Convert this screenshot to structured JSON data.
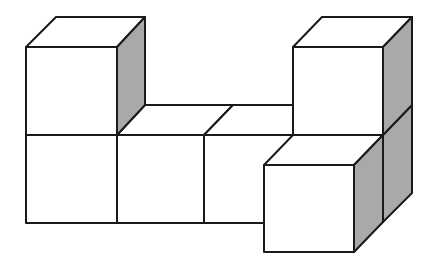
{
  "diagram": {
    "type": "isometric-cube-structure",
    "colors": {
      "front_face": "#ffffff",
      "top_face": "#ffffff",
      "side_face_shaded": "#a9a9a9",
      "edge": "#1a1a1a",
      "background": "#ffffff"
    },
    "cube_count": 7,
    "cubes": [
      {
        "id": "top-left",
        "layer": 2,
        "column": 1,
        "depth": 1
      },
      {
        "id": "bottom-1",
        "layer": 1,
        "column": 1,
        "depth": 1
      },
      {
        "id": "bottom-2",
        "layer": 1,
        "column": 2,
        "depth": 1
      },
      {
        "id": "bottom-3",
        "layer": 1,
        "column": 3,
        "depth": 1
      },
      {
        "id": "bottom-4",
        "layer": 1,
        "column": 4,
        "depth": 1
      },
      {
        "id": "top-right",
        "layer": 2,
        "column": 4,
        "depth": 1
      },
      {
        "id": "front-right",
        "layer": 1,
        "column": 4,
        "depth": 0
      }
    ]
  }
}
